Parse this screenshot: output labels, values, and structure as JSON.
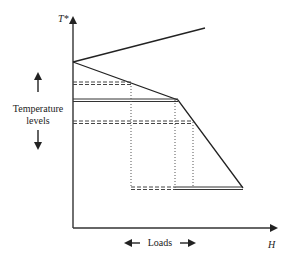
{
  "diagram": {
    "y_axis_label": "T*",
    "x_axis_label": "H",
    "side_label_line1": "Temperature",
    "side_label_line2": "levels",
    "bottom_label": "Loads",
    "colors": {
      "line": "#222222",
      "dashed": "#444444",
      "dotted": "#555555",
      "background": "#ffffff"
    },
    "geometry": {
      "origin": [
        73,
        228
      ],
      "apex": [
        73,
        62
      ],
      "upper_line_end": [
        205,
        28
      ],
      "lower_break": [
        178,
        100
      ],
      "lower_end": [
        243,
        188
      ],
      "dashed_levels_y": [
        83,
        122,
        188
      ],
      "double_levels_y": [
        100,
        188
      ],
      "dotted_verticals_x": [
        131,
        175,
        193
      ]
    }
  }
}
